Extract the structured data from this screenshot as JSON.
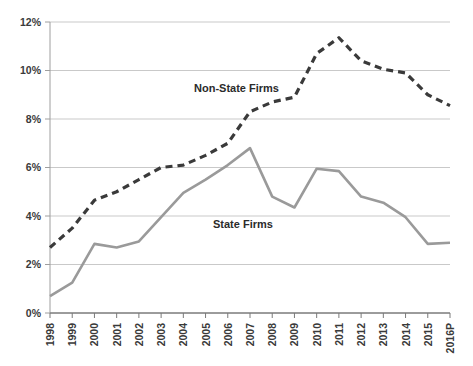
{
  "chart_data": {
    "type": "line",
    "title": "",
    "subtitle": "",
    "xlabel": "",
    "ylabel": "",
    "grid": true,
    "legend_position": "inline-annotation",
    "ylim": [
      0,
      12
    ],
    "ytick_step": 2,
    "ytick_labels": [
      "0%",
      "2%",
      "4%",
      "6%",
      "8%",
      "10%",
      "12%"
    ],
    "ytick_values": [
      0,
      2,
      4,
      6,
      8,
      10,
      12
    ],
    "categories": [
      "1998",
      "1999",
      "2000",
      "2001",
      "2002",
      "2003",
      "2004",
      "2005",
      "2006",
      "2007",
      "2008",
      "2009",
      "2010",
      "2011",
      "2012",
      "2013",
      "2014",
      "2015",
      "2016P"
    ],
    "series": [
      {
        "name": "Non-State Firms",
        "style": "dashed",
        "color": "#3a3a3a",
        "annotation_label": "Non-State Firms",
        "values": [
          2.7,
          3.5,
          4.65,
          5.0,
          5.5,
          6.0,
          6.1,
          6.5,
          7.0,
          8.3,
          8.7,
          8.9,
          10.7,
          11.35,
          10.4,
          10.05,
          9.9,
          9.0,
          8.55
        ]
      },
      {
        "name": "State Firms",
        "style": "solid",
        "color": "#9a9a9a",
        "annotation_label": "State Firms",
        "values": [
          0.7,
          1.25,
          2.85,
          2.7,
          2.95,
          3.95,
          4.95,
          5.5,
          6.1,
          6.8,
          4.8,
          4.35,
          5.95,
          5.85,
          4.8,
          4.55,
          3.95,
          2.85,
          2.9
        ]
      }
    ]
  },
  "annotations": {
    "non_state_label": "Non-State Firms",
    "state_label": "State Firms"
  }
}
